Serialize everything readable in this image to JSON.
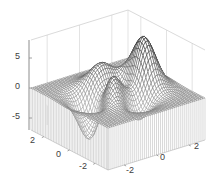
{
  "chart_data": {
    "type": "mesh3d",
    "function": "peaks",
    "title": "",
    "xlabel": "",
    "ylabel": "",
    "zlabel": "",
    "x_ticks": [
      -2,
      0,
      2
    ],
    "y_ticks": [
      -2,
      0,
      2
    ],
    "z_ticks": [
      -5,
      0,
      5
    ],
    "xlim": [
      -3,
      3
    ],
    "ylim": [
      -3,
      3
    ],
    "zlim": [
      -7,
      8
    ],
    "grid": true,
    "legend": null,
    "style": "meshz curtain, black/gray wireframe on white",
    "grid_size": 49,
    "surface_summary": {
      "main_peak": {
        "x": 0,
        "y": 1.6,
        "z": 8.1
      },
      "second_peak": {
        "x": -0.5,
        "y": -0.6,
        "z": 3.8
      },
      "third_peak": {
        "x": 1.3,
        "y": 0.0,
        "z": 3.6
      },
      "deep_trough": {
        "x": 0.2,
        "y": -1.6,
        "z": -6.5
      },
      "secondary_trough": {
        "x": -1.4,
        "y": 0.2,
        "z": -3.0
      }
    }
  },
  "axes": {
    "z_tick_labels": [
      "5",
      "0",
      "-5"
    ],
    "x_tick_labels": [
      "2",
      "0",
      "-2"
    ],
    "y_tick_labels": [
      "-2",
      "0",
      "2"
    ]
  },
  "colors": {
    "background": "#ffffff",
    "mesh_line": "#1a1a1a",
    "curtain_line": "#b0b0b0",
    "box_line": "#d0d0d0",
    "axis_line": "#8c8c8c",
    "tick_text": "#404040"
  }
}
